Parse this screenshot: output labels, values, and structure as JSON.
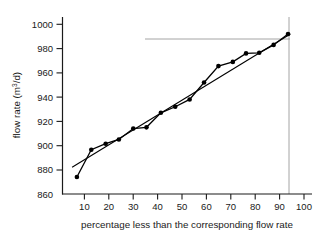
{
  "chart_data": {
    "type": "scatter",
    "title": "",
    "xlabel": "percentage less than the corresponding flow rate",
    "ylabel": "flow rate (m3/d)",
    "ylabel_parts": {
      "pre": "flow rate (m",
      "sup": "3",
      "post": "/d)"
    },
    "xlim": [
      0,
      104
    ],
    "ylim": [
      860,
      1004
    ],
    "xticks": [
      10,
      20,
      30,
      40,
      50,
      60,
      70,
      80,
      90,
      100
    ],
    "yticks": [
      860,
      880,
      900,
      920,
      940,
      960,
      980,
      1000
    ],
    "grid": false,
    "legend": false,
    "marker": "filled-circle",
    "series": [
      {
        "name": "measured flow rate",
        "x": [
          6,
          12,
          18,
          23.5,
          29.5,
          35,
          41,
          47,
          53,
          59,
          65,
          71,
          76.5,
          82,
          88,
          94
        ],
        "y": [
          874,
          896.5,
          901.5,
          905,
          914,
          915,
          927,
          932,
          938,
          952,
          965.5,
          969,
          976,
          976.5,
          983,
          992
        ]
      },
      {
        "name": "fitted straight line",
        "x": [
          4,
          95
        ],
        "y": [
          882,
          992
        ]
      }
    ],
    "reference_lines": [
      {
        "name": "vertical-90-percent",
        "orientation": "vertical",
        "value": 90,
        "color": "#9a9a9a"
      },
      {
        "name": "horizontal-987",
        "orientation": "horizontal",
        "value": 987,
        "from_x": 35,
        "to_x": 90,
        "color": "#9a9a9a"
      }
    ],
    "colors": {
      "axis": "#1a1a1a",
      "data": "#000000",
      "reference": "#9a9a9a"
    }
  }
}
